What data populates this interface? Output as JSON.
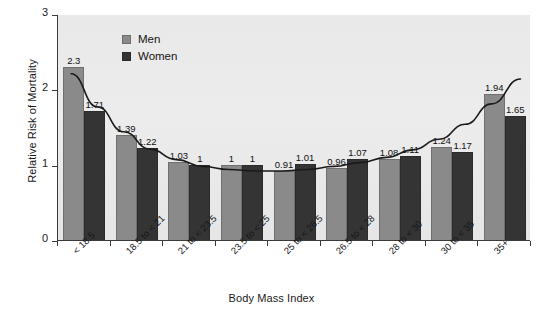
{
  "chart_data": {
    "type": "bar",
    "title": "",
    "subtitle": "",
    "xlabel": "Body Mass Index",
    "ylabel": "Relative Risk of Mortality",
    "ylim": [
      0,
      3
    ],
    "yticks": [
      "0",
      "1",
      "2",
      "3"
    ],
    "grid": false,
    "legend_position": "top-left",
    "categories": [
      "< 18.5",
      "18.5 to < 21",
      "21 to < 23.5",
      "23.5 to < 25",
      "25 to < 26.5",
      "26.5 to < 28",
      "28 to < 30",
      "30 to < 35",
      "35+"
    ],
    "series": [
      {
        "name": "Men",
        "color": "#8a8a8a",
        "values": [
          2.3,
          1.39,
          1.03,
          1,
          0.91,
          0.96,
          1.08,
          1.24,
          1.94
        ],
        "labels": [
          "2.3",
          "1.39",
          "1.03",
          "1",
          "0.91",
          "0.96",
          "1.08",
          "1.24",
          "1.94"
        ]
      },
      {
        "name": "Women",
        "color": "#343434",
        "values": [
          1.71,
          1.22,
          1,
          1,
          1.01,
          1.07,
          1.11,
          1.17,
          1.65
        ],
        "labels": [
          "1.71",
          "1.22",
          "1",
          "1",
          "1.01",
          "1.07",
          "1.11",
          "1.17",
          "1.65"
        ]
      }
    ],
    "trend_curve": {
      "description": "J-shaped fitted mortality risk curve",
      "color": "#1a1a1a",
      "points": [
        [
          0.25,
          2.22
        ],
        [
          0.75,
          1.78
        ],
        [
          1.25,
          1.45
        ],
        [
          1.75,
          1.22
        ],
        [
          2.25,
          1.08
        ],
        [
          2.75,
          0.99
        ],
        [
          3.25,
          0.95
        ],
        [
          3.75,
          0.93
        ],
        [
          4.25,
          0.93
        ],
        [
          4.75,
          0.95
        ],
        [
          5.25,
          0.99
        ],
        [
          5.75,
          1.04
        ],
        [
          6.25,
          1.11
        ],
        [
          6.75,
          1.21
        ],
        [
          7.25,
          1.35
        ],
        [
          7.75,
          1.55
        ],
        [
          8.25,
          1.82
        ],
        [
          8.8,
          2.15
        ]
      ]
    }
  },
  "legend": {
    "items": [
      {
        "label": "Men",
        "color": "#8a8a8a"
      },
      {
        "label": "Women",
        "color": "#343434"
      }
    ]
  },
  "axes": {
    "y_title": "Relative Risk of Mortality",
    "x_title": "Body Mass Index"
  }
}
